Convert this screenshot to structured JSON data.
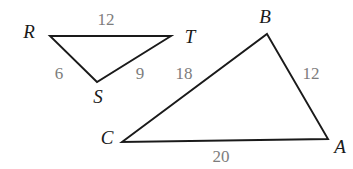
{
  "figure": {
    "background_color": "#ffffff",
    "stroke_color": "#1a1a1a",
    "vertex_label_color": "#1a1a1a",
    "side_label_color": "#7d7d7d"
  },
  "triangles": [
    {
      "name": "RST",
      "vertices": [
        {
          "id": "R",
          "label": "R",
          "x": 50,
          "y": 36,
          "label_x": 29,
          "label_y": 31
        },
        {
          "id": "T",
          "label": "T",
          "x": 171,
          "y": 36,
          "label_x": 190,
          "label_y": 36
        },
        {
          "id": "S",
          "label": "S",
          "x": 97,
          "y": 82,
          "label_x": 98,
          "label_y": 96
        }
      ],
      "sides": [
        {
          "from": "R",
          "to": "T",
          "label": "12",
          "label_x": 106,
          "label_y": 19
        },
        {
          "from": "R",
          "to": "S",
          "label": "6",
          "label_x": 59,
          "label_y": 73
        },
        {
          "from": "S",
          "to": "T",
          "label": "9",
          "label_x": 140,
          "label_y": 73
        }
      ]
    },
    {
      "name": "ABC",
      "vertices": [
        {
          "id": "B",
          "label": "B",
          "x": 267,
          "y": 34,
          "label_x": 265,
          "label_y": 16
        },
        {
          "id": "A",
          "label": "A",
          "x": 328,
          "y": 139,
          "label_x": 340,
          "label_y": 146
        },
        {
          "id": "C",
          "label": "C",
          "x": 122,
          "y": 142,
          "label_x": 107,
          "label_y": 137
        }
      ],
      "sides": [
        {
          "from": "C",
          "to": "B",
          "label": "18",
          "label_x": 184,
          "label_y": 73
        },
        {
          "from": "B",
          "to": "A",
          "label": "12",
          "label_x": 311,
          "label_y": 73
        },
        {
          "from": "C",
          "to": "A",
          "label": "20",
          "label_x": 221,
          "label_y": 156
        }
      ]
    }
  ]
}
